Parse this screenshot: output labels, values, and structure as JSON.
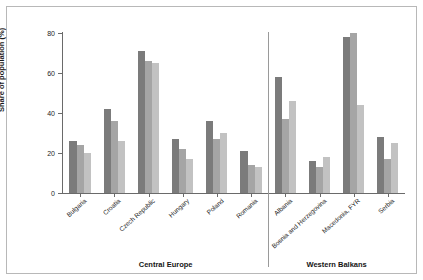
{
  "chart_data": {
    "type": "bar",
    "title": "",
    "xlabel": "",
    "ylabel": "Share of population (%)",
    "ylim": [
      0,
      80
    ],
    "yticks": [
      0,
      20,
      40,
      60,
      80
    ],
    "grid": false,
    "legend": "none",
    "categories": [
      "Bulgaria",
      "Croatia",
      "Czech Republic",
      "Hungary",
      "Poland",
      "Romania",
      "Albania",
      "Bosnia and Herzegovina",
      "Macedonia, FYR",
      "Serbia"
    ],
    "series": [
      {
        "name": "series-1",
        "color": "#7b7b7b",
        "values": [
          26,
          42,
          71,
          27,
          36,
          21,
          58,
          16,
          78,
          28
        ]
      },
      {
        "name": "series-2",
        "color": "#a5a5a5",
        "values": [
          24,
          36,
          66,
          22,
          27,
          14,
          37,
          13,
          80,
          17
        ]
      },
      {
        "name": "series-3",
        "color": "#c2c2c2",
        "values": [
          20,
          26,
          65,
          17,
          30,
          13,
          46,
          18,
          44,
          25
        ]
      }
    ],
    "regions": [
      {
        "label": "Central Europe",
        "categories": [
          "Bulgaria",
          "Croatia",
          "Czech Republic",
          "Hungary",
          "Poland",
          "Romania"
        ]
      },
      {
        "label": "Western Balkans",
        "categories": [
          "Albania",
          "Bosnia and Herzegovina",
          "Macedonia, FYR",
          "Serbia"
        ]
      }
    ]
  }
}
